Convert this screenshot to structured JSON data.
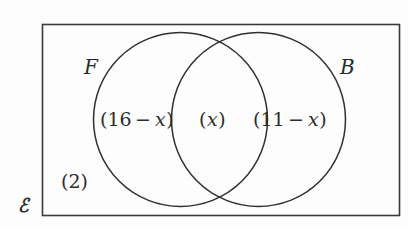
{
  "diagram": {
    "type": "venn-two-set",
    "universal_set_symbol": "ℰ",
    "outside_count": "(2)",
    "sets": [
      {
        "id": "F",
        "label": "F",
        "name": "set-f"
      },
      {
        "id": "B",
        "label": "B",
        "name": "set-b"
      }
    ],
    "regions": [
      {
        "id": "f-only",
        "name": "left-only-region",
        "open_paren": "(",
        "value": "16",
        "operator": "−",
        "variable": "x",
        "close_paren": ")"
      },
      {
        "id": "f-and-b",
        "name": "intersection-region",
        "open_paren": "(",
        "variable": "x",
        "close_paren": ")"
      },
      {
        "id": "b-only",
        "name": "right-only-region",
        "open_paren": "(",
        "value": "11",
        "operator": "−",
        "variable": "x",
        "close_paren": ")"
      }
    ],
    "colors": {
      "stroke": "#2f2f2f",
      "rect_stroke": "#3a3a3a",
      "text": "#2d2d2d",
      "background": "#fdfdfd"
    }
  }
}
